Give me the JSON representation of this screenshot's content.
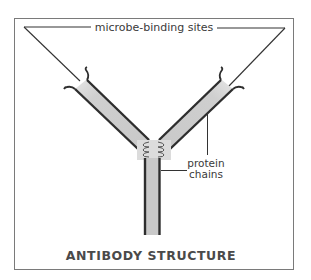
{
  "diagram": {
    "title": "ANTIBODY STRUCTURE",
    "labels": {
      "binding_sites": "microbe-binding sites",
      "protein_chains_line1": "protein",
      "protein_chains_line2": "chains"
    },
    "colors": {
      "frame": "#7a7a7a",
      "chain_line": "#2e2e2e",
      "chain_fill": "#c9c9c9",
      "callout_line": "#333333",
      "text": "#3a3a3a"
    },
    "parts": [
      "left arm",
      "right arm",
      "hinge",
      "stem",
      "binding sites",
      "protein chains"
    ]
  }
}
